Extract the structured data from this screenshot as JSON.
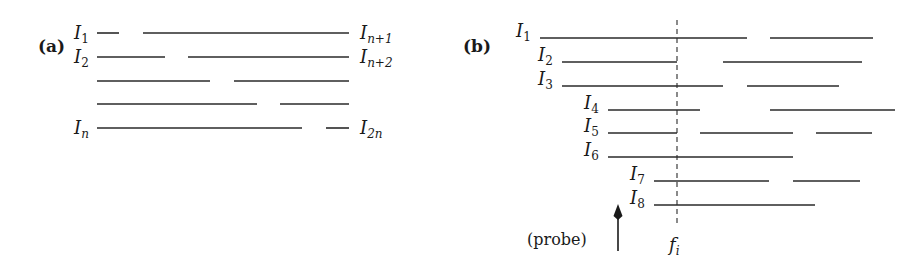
{
  "panel_a": {
    "label": "(a)",
    "left_labels": [
      {
        "base": "I",
        "sub": "1",
        "y": 33
      },
      {
        "base": "I",
        "sub": "2",
        "y": 57
      },
      {
        "base": "I",
        "sub": "n",
        "y": 128
      }
    ],
    "right_labels": [
      {
        "base": "I",
        "sub": "n+1",
        "y": 33
      },
      {
        "base": "I",
        "sub": "n+2",
        "y": 57
      },
      {
        "base": "I",
        "sub": "2n",
        "y": 128
      }
    ],
    "rows": [
      {
        "y": 33,
        "segments": [
          [
            97,
            119
          ],
          [
            143,
            349
          ]
        ]
      },
      {
        "y": 57,
        "segments": [
          [
            97,
            165
          ],
          [
            188,
            349
          ]
        ]
      },
      {
        "y": 81,
        "segments": [
          [
            97,
            210
          ],
          [
            234,
            349
          ]
        ]
      },
      {
        "y": 104,
        "segments": [
          [
            97,
            257
          ],
          [
            280,
            349
          ]
        ]
      },
      {
        "y": 128,
        "segments": [
          [
            97,
            302
          ],
          [
            326,
            349
          ]
        ]
      }
    ]
  },
  "panel_b": {
    "label": "(b)",
    "rows": [
      {
        "label": "I",
        "sub": "1",
        "label_x": 516,
        "y": 38,
        "segments": [
          [
            540,
            747
          ],
          [
            770,
            873
          ]
        ]
      },
      {
        "label": "I",
        "sub": "2",
        "label_x": 538,
        "y": 62,
        "segments": [
          [
            562,
            677
          ],
          [
            723,
            862
          ]
        ]
      },
      {
        "label": "I",
        "sub": "3",
        "label_x": 538,
        "y": 86,
        "segments": [
          [
            562,
            723
          ],
          [
            747,
            839
          ]
        ]
      },
      {
        "label": "I",
        "sub": "4",
        "label_x": 584,
        "y": 110,
        "segments": [
          [
            608,
            700
          ],
          [
            770,
            895
          ]
        ]
      },
      {
        "label": "I",
        "sub": "5",
        "label_x": 584,
        "y": 133,
        "segments": [
          [
            608,
            677
          ],
          [
            700,
            793
          ],
          [
            816,
            872
          ]
        ]
      },
      {
        "label": "I",
        "sub": "6",
        "label_x": 584,
        "y": 157,
        "segments": [
          [
            608,
            793
          ]
        ]
      },
      {
        "label": "I",
        "sub": "7",
        "label_x": 630,
        "y": 181,
        "segments": [
          [
            654,
            769
          ],
          [
            793,
            860
          ]
        ]
      },
      {
        "label": "I",
        "sub": "8",
        "label_x": 630,
        "y": 205,
        "segments": [
          [
            654,
            815
          ]
        ]
      }
    ],
    "probe_line": {
      "x": 677,
      "y_top": 20,
      "y_bottom": 226
    },
    "probe_line_label": {
      "base": "f",
      "sub": "i"
    },
    "probe_arrow_label": "(probe)"
  }
}
